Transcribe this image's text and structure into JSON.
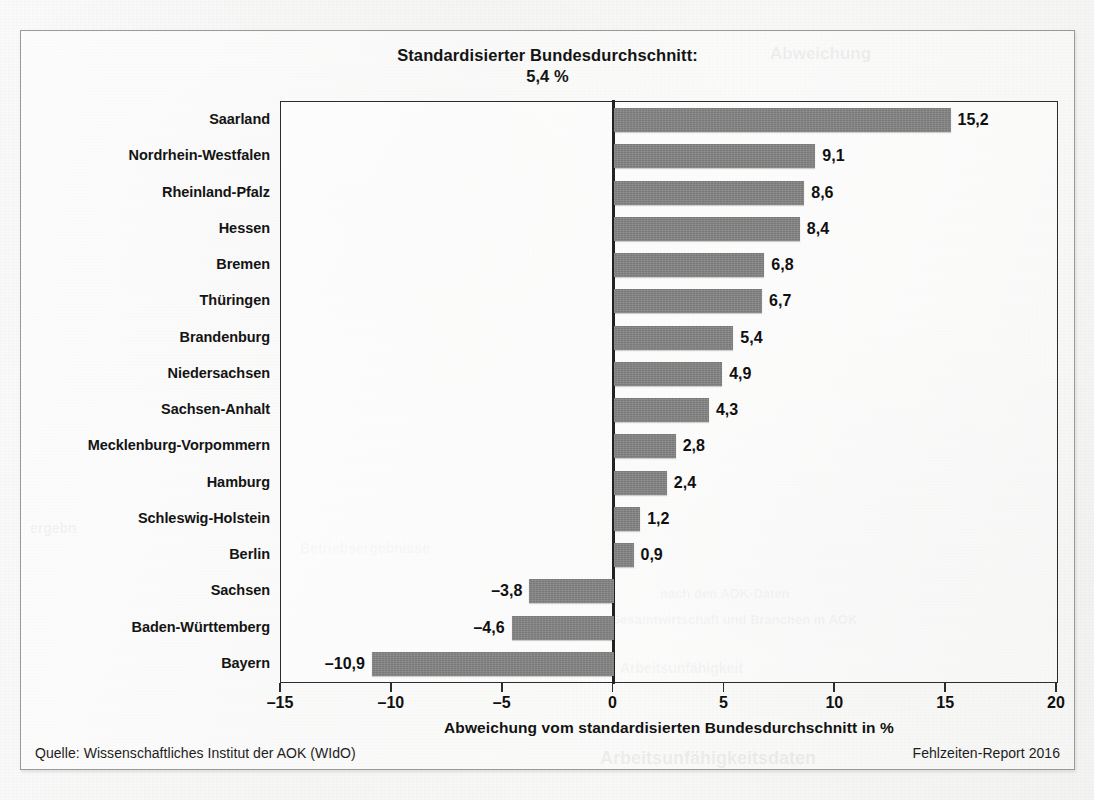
{
  "figure": {
    "header_line1": "Standardisierter Bundesdurchschnitt:",
    "header_line2": "5,4 %",
    "source_label": "Quelle: Wissenschaftliches Institut der AOK (WIdO)",
    "report_label": "Fehlzeiten-Report 2016"
  },
  "ghost_text": {
    "top_right": "Abweichung",
    "mid_left": "ergebn",
    "mid_center": "Betriebsergebnisse",
    "mid_right": "nach den AOK-Daten",
    "lower_right": "Gesamtwirtschaft und Branchen in AOK",
    "low_left": "Arbeitsunfähigkeit",
    "bottom_right": "Arbeitsunfähigkeitsdaten"
  },
  "chart_data": {
    "type": "bar",
    "orientation": "horizontal",
    "title": "Standardisierter Bundesdurchschnitt: 5,4 %",
    "subtitle": "5,4 %",
    "xlabel": "Abweichung vom standardisierten Bundesdurchschnitt in %",
    "ylabel": "",
    "xlim": [
      -15,
      20
    ],
    "xticks": [
      -15,
      -10,
      -5,
      0,
      5,
      10,
      15,
      20
    ],
    "xtick_labels": [
      "–15",
      "–10",
      "–5",
      "0",
      "5",
      "10",
      "15",
      "20"
    ],
    "grid": false,
    "legend": false,
    "bar_color": "#858585",
    "reference_value": 5.4,
    "categories": [
      "Saarland",
      "Nordrhein-Westfalen",
      "Rheinland-Pfalz",
      "Hessen",
      "Bremen",
      "Thüringen",
      "Brandenburg",
      "Niedersachsen",
      "Sachsen-Anhalt",
      "Mecklenburg-Vorpommern",
      "Hamburg",
      "Schleswig-Holstein",
      "Berlin",
      "Sachsen",
      "Baden-Württemberg",
      "Bayern"
    ],
    "values": [
      15.2,
      9.1,
      8.6,
      8.4,
      6.8,
      6.7,
      5.4,
      4.9,
      4.3,
      2.8,
      2.4,
      1.2,
      0.9,
      -3.8,
      -4.6,
      -10.9
    ],
    "value_labels": [
      "15,2",
      "9,1",
      "8,6",
      "8,4",
      "6,8",
      "6,7",
      "5,4",
      "4,9",
      "4,3",
      "2,8",
      "2,4",
      "1,2",
      "0,9",
      "–3,8",
      "–4,6",
      "–10,9"
    ]
  }
}
